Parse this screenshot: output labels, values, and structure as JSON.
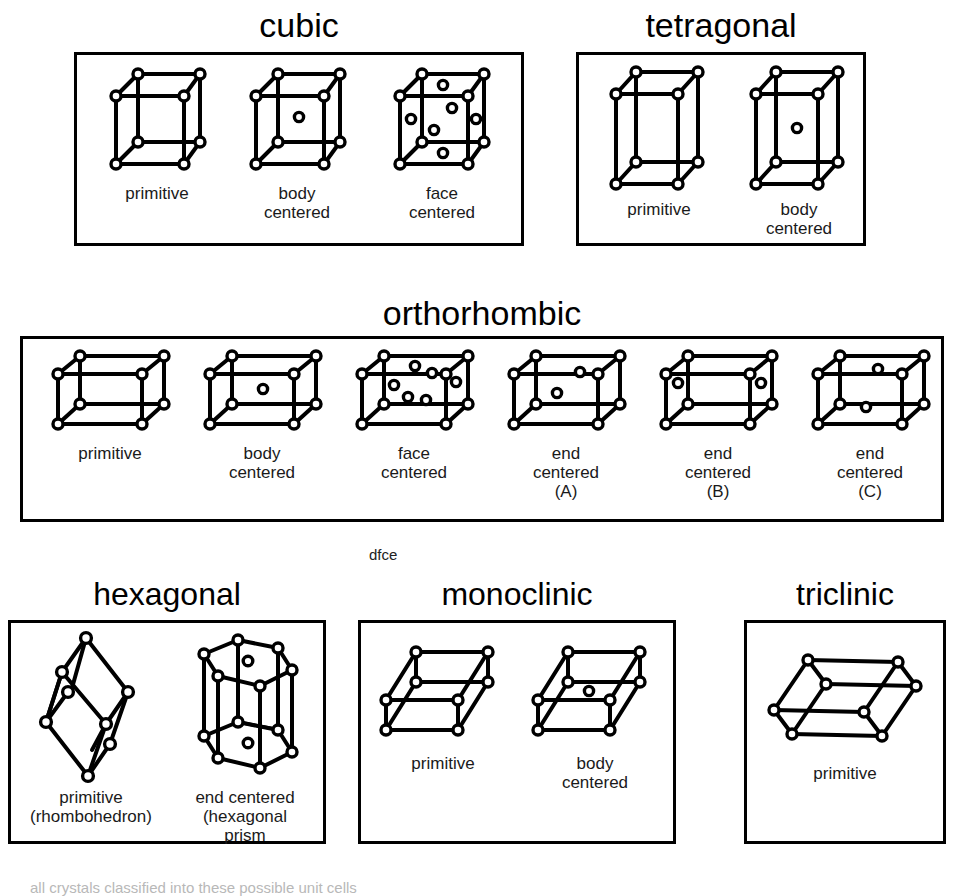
{
  "figure": {
    "stray_note": "dfce",
    "footer_clipped": "all crystals classified into these possible unit cells"
  },
  "systems": [
    {
      "id": "cubic",
      "title": "cubic",
      "cells": [
        {
          "id": "cubic-primitive",
          "caption": "primitive",
          "shape": "cube",
          "centers": "none"
        },
        {
          "id": "cubic-body-centered",
          "caption": "body\ncentered",
          "shape": "cube",
          "centers": "body"
        },
        {
          "id": "cubic-face-centered",
          "caption": "face\ncentered",
          "shape": "cube",
          "centers": "face"
        }
      ]
    },
    {
      "id": "tetragonal",
      "title": "tetragonal",
      "cells": [
        {
          "id": "tetragonal-primitive",
          "caption": "primitive",
          "shape": "tall-box",
          "centers": "none"
        },
        {
          "id": "tetragonal-body-centered",
          "caption": "body\ncentered",
          "shape": "tall-box",
          "centers": "body"
        }
      ]
    },
    {
      "id": "orthorhombic",
      "title": "orthorhombic",
      "cells": [
        {
          "id": "orthorhombic-primitive",
          "caption": "primitive",
          "shape": "flat-box",
          "centers": "none"
        },
        {
          "id": "orthorhombic-body-centered",
          "caption": "body\ncentered",
          "shape": "flat-box",
          "centers": "body"
        },
        {
          "id": "orthorhombic-face-centered",
          "caption": "face\ncentered",
          "shape": "flat-box",
          "centers": "face"
        },
        {
          "id": "orthorhombic-end-centered-a",
          "caption": "end\ncentered (A)",
          "shape": "flat-box",
          "centers": "end-a"
        },
        {
          "id": "orthorhombic-end-centered-b",
          "caption": "end\ncentered (B)",
          "shape": "flat-box",
          "centers": "end-b"
        },
        {
          "id": "orthorhombic-end-centered-c",
          "caption": "end\ncentered (C)",
          "shape": "flat-box",
          "centers": "end-c"
        }
      ]
    },
    {
      "id": "hexagonal",
      "title": "hexagonal",
      "cells": [
        {
          "id": "hexagonal-primitive",
          "caption": "primitive\n(rhombohedron)",
          "shape": "rhombohedron",
          "centers": "none"
        },
        {
          "id": "hexagonal-end-centered",
          "caption": "end centered\n(hexagonal\nprism",
          "shape": "hex-prism",
          "centers": "end"
        }
      ]
    },
    {
      "id": "monoclinic",
      "title": "monoclinic",
      "cells": [
        {
          "id": "monoclinic-primitive",
          "caption": "primitive",
          "shape": "slanted-box",
          "centers": "none"
        },
        {
          "id": "monoclinic-body-centered",
          "caption": "body\ncentered",
          "shape": "slanted-box",
          "centers": "body"
        }
      ]
    },
    {
      "id": "triclinic",
      "title": "triclinic",
      "cells": [
        {
          "id": "triclinic-primitive",
          "caption": "primitive",
          "shape": "triclinic-box",
          "centers": "none"
        }
      ]
    }
  ],
  "style": {
    "line_color": "#000000",
    "fill_color": "#ffffff",
    "background": "#ffffff"
  }
}
